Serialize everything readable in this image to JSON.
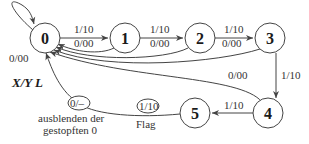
{
  "diagram": {
    "type": "state-machine",
    "legend": "X/Y L",
    "states": [
      {
        "id": "0",
        "label": "0",
        "x": 45,
        "y": 38
      },
      {
        "id": "1",
        "label": "1",
        "x": 125,
        "y": 38
      },
      {
        "id": "2",
        "label": "2",
        "x": 200,
        "y": 38
      },
      {
        "id": "3",
        "label": "3",
        "x": 270,
        "y": 38
      },
      {
        "id": "4",
        "label": "4",
        "x": 268,
        "y": 113
      },
      {
        "id": "5",
        "label": "5",
        "x": 195,
        "y": 113
      }
    ],
    "transitions": [
      {
        "from": "0",
        "to": "0",
        "label": "0/00"
      },
      {
        "from": "0",
        "to": "1",
        "label": "1/10"
      },
      {
        "from": "1",
        "to": "0",
        "label": "0/00"
      },
      {
        "from": "1",
        "to": "2",
        "label": "1/10"
      },
      {
        "from": "2",
        "to": "0",
        "label": "0/00"
      },
      {
        "from": "2",
        "to": "3",
        "label": "1/10"
      },
      {
        "from": "3",
        "to": "0",
        "label": "0/00"
      },
      {
        "from": "3",
        "to": "4",
        "label": "1/10"
      },
      {
        "from": "4",
        "to": "0",
        "label": "0/00"
      },
      {
        "from": "4",
        "to": "5",
        "label": "1/10"
      },
      {
        "from": "5",
        "to": "0",
        "label": "0/-"
      },
      {
        "from": "5",
        "to": "0",
        "label": "1/10"
      }
    ],
    "annotations": {
      "stuffed_zero_label": "0/–",
      "stuffed_zero_note_line1": "ausblenden der",
      "stuffed_zero_note_line2": "gestopften 0",
      "flag_label": "1/10",
      "flag_note": "Flag"
    }
  }
}
